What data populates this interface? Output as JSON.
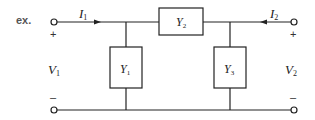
{
  "example_label": "ex.",
  "diagram": {
    "type": "two-port pi network",
    "currents": [
      {
        "symbol": "I",
        "subscript": "1",
        "direction": "into port 1"
      },
      {
        "symbol": "I",
        "subscript": "2",
        "direction": "into port 2"
      }
    ],
    "voltages": [
      {
        "symbol": "V",
        "subscript": "1",
        "plus": "+",
        "minus": "–"
      },
      {
        "symbol": "V",
        "subscript": "2",
        "plus": "+",
        "minus": "–"
      }
    ],
    "admittances": [
      {
        "symbol": "Y",
        "subscript": "1",
        "position": "shunt left"
      },
      {
        "symbol": "Y",
        "subscript": "2",
        "position": "series top"
      },
      {
        "symbol": "Y",
        "subscript": "3",
        "position": "shunt right"
      }
    ]
  },
  "colors": {
    "line": "#222222",
    "text": "#222222",
    "ex_label": "#555555"
  }
}
